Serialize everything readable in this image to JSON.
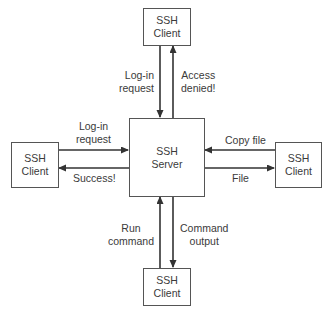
{
  "server": {
    "line1": "SSH",
    "line2": "Server"
  },
  "clients": {
    "top": {
      "line1": "SSH",
      "line2": "Client"
    },
    "left": {
      "line1": "SSH",
      "line2": "Client"
    },
    "right": {
      "line1": "SSH",
      "line2": "Client"
    },
    "bottom": {
      "line1": "SSH",
      "line2": "Client"
    }
  },
  "edges": {
    "top_to_server": {
      "line1": "Log-in",
      "line2": "request"
    },
    "server_to_top": {
      "line1": "Access",
      "line2": "denied!"
    },
    "left_to_server": {
      "line1": "Log-in",
      "line2": "request"
    },
    "server_to_left": {
      "line1": "Success!"
    },
    "right_to_server": {
      "line1": "Copy file"
    },
    "server_to_right": {
      "line1": "File"
    },
    "bottom_to_server": {
      "line1": "Run",
      "line2": "command"
    },
    "server_to_bottom": {
      "line1": "Command",
      "line2": "output"
    }
  },
  "colors": {
    "line": "#333333",
    "text": "#3a3a3a"
  }
}
